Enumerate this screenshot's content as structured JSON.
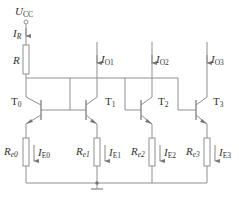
{
  "diagram": {
    "type": "circuit",
    "supply": {
      "symbol": "U",
      "sub": "CC"
    },
    "reference_current": {
      "symbol": "I",
      "sub": "R"
    },
    "reference_resistor": {
      "symbol": "R"
    },
    "transistors": [
      {
        "symbol": "T",
        "sub": "0"
      },
      {
        "symbol": "T",
        "sub": "1"
      },
      {
        "symbol": "T",
        "sub": "2"
      },
      {
        "symbol": "T",
        "sub": "3"
      }
    ],
    "output_currents": [
      {
        "symbol": "I",
        "sub": "O1"
      },
      {
        "symbol": "I",
        "sub": "O2"
      },
      {
        "symbol": "I",
        "sub": "O3"
      }
    ],
    "emitter_resistors": [
      {
        "symbol": "R",
        "sub": "e0"
      },
      {
        "symbol": "R",
        "sub": "e1"
      },
      {
        "symbol": "R",
        "sub": "e2"
      },
      {
        "symbol": "R",
        "sub": "e3"
      }
    ],
    "emitter_currents": [
      {
        "symbol": "I",
        "sub": "E0"
      },
      {
        "symbol": "I",
        "sub": "E1"
      },
      {
        "symbol": "I",
        "sub": "E2"
      },
      {
        "symbol": "I",
        "sub": "E3"
      }
    ],
    "colors": {
      "wire": "#8a8a8a",
      "text": "#333333",
      "background": "#ffffff"
    }
  }
}
